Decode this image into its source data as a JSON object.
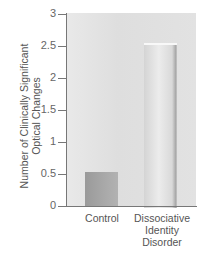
{
  "chart_data": {
    "type": "bar",
    "title": "",
    "xlabel": "",
    "ylabel": "Number of Clinically Significant Optical Changes",
    "ylabel_lines": [
      "Number of Clinically Significant",
      "Optical Changes"
    ],
    "categories": [
      "Control",
      "Dissociative Identity Disorder"
    ],
    "category_label_lines": [
      [
        "Control"
      ],
      [
        "Dissociative",
        "Identity",
        "Disorder"
      ]
    ],
    "values": [
      0.53,
      2.55
    ],
    "ylim": [
      0,
      3
    ],
    "yticks": [
      "0",
      "0.5",
      "1",
      "1.5",
      "2",
      "2.5",
      "3"
    ],
    "grid": false,
    "legend": null,
    "colors": {
      "control": "#a4a4a4",
      "did": "#e2e2e2",
      "panel": "#e4e4e4",
      "axis": "#777777"
    }
  }
}
